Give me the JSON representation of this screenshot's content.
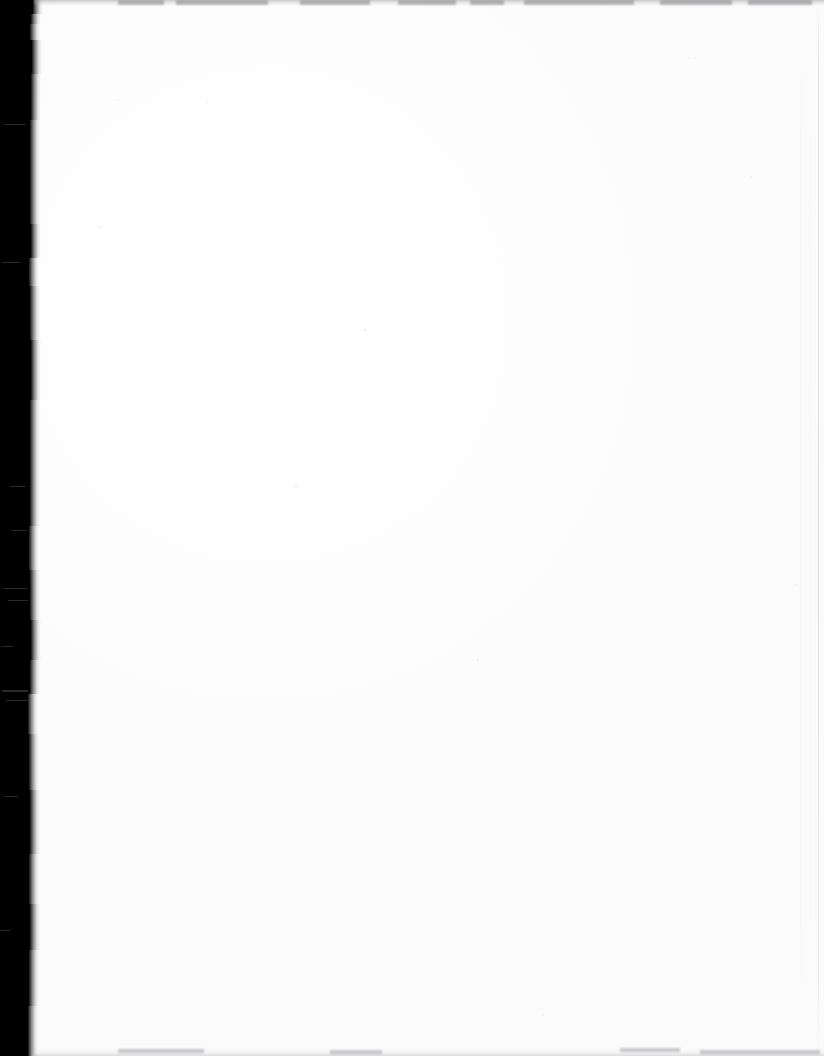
{
  "page": {
    "width": 824,
    "height": 1056,
    "background_color": "#ffffff",
    "paper_color": "#fefefe",
    "content_text": "",
    "visible_text_present": false
  },
  "scan_edge": {
    "name": "left-scanner-bed-band",
    "color": "#000000",
    "x": 0,
    "width_min": 27,
    "width_max": 34,
    "height": 1056,
    "segments": [
      {
        "top": 0,
        "height": 14,
        "width": 33
      },
      {
        "top": 14,
        "height": 10,
        "width": 31
      },
      {
        "top": 24,
        "height": 16,
        "width": 30
      },
      {
        "top": 40,
        "height": 34,
        "width": 32
      },
      {
        "top": 74,
        "height": 46,
        "width": 31
      },
      {
        "top": 120,
        "height": 60,
        "width": 30
      },
      {
        "top": 180,
        "height": 44,
        "width": 30
      },
      {
        "top": 224,
        "height": 34,
        "width": 31
      },
      {
        "top": 258,
        "height": 28,
        "width": 29
      },
      {
        "top": 286,
        "height": 54,
        "width": 30
      },
      {
        "top": 340,
        "height": 60,
        "width": 31
      },
      {
        "top": 400,
        "height": 70,
        "width": 30
      },
      {
        "top": 470,
        "height": 56,
        "width": 30
      },
      {
        "top": 526,
        "height": 44,
        "width": 29
      },
      {
        "top": 570,
        "height": 50,
        "width": 30
      },
      {
        "top": 620,
        "height": 40,
        "width": 31
      },
      {
        "top": 660,
        "height": 34,
        "width": 30
      },
      {
        "top": 694,
        "height": 40,
        "width": 28
      },
      {
        "top": 734,
        "height": 56,
        "width": 29
      },
      {
        "top": 790,
        "height": 64,
        "width": 30
      },
      {
        "top": 854,
        "height": 50,
        "width": 29
      },
      {
        "top": 904,
        "height": 46,
        "width": 30
      },
      {
        "top": 950,
        "height": 56,
        "width": 29
      },
      {
        "top": 1006,
        "height": 50,
        "width": 28
      }
    ],
    "scratches": [
      {
        "top": 124,
        "left": 4,
        "width": 22,
        "height": 1
      },
      {
        "top": 262,
        "left": 2,
        "width": 18,
        "height": 1
      },
      {
        "top": 486,
        "left": 10,
        "width": 16,
        "height": 1
      },
      {
        "top": 530,
        "left": 12,
        "width": 15,
        "height": 1
      },
      {
        "top": 588,
        "left": 3,
        "width": 24,
        "height": 1
      },
      {
        "top": 600,
        "left": 8,
        "width": 20,
        "height": 1
      },
      {
        "top": 646,
        "left": 1,
        "width": 12,
        "height": 1
      },
      {
        "top": 690,
        "left": 2,
        "width": 26,
        "height": 2
      },
      {
        "top": 700,
        "left": 6,
        "width": 22,
        "height": 1
      },
      {
        "top": 796,
        "left": 4,
        "width": 14,
        "height": 1
      },
      {
        "top": 930,
        "left": 0,
        "width": 10,
        "height": 1
      }
    ]
  },
  "top_edge": {
    "name": "top-smudge-line",
    "color": "#82828455",
    "y": 0,
    "height": 6,
    "blotches": [
      {
        "left": 118,
        "width": 46
      },
      {
        "left": 176,
        "width": 92
      },
      {
        "left": 300,
        "width": 70
      },
      {
        "left": 398,
        "width": 58
      },
      {
        "left": 470,
        "width": 34
      },
      {
        "left": 524,
        "width": 110
      },
      {
        "left": 660,
        "width": 72
      },
      {
        "left": 748,
        "width": 64
      }
    ]
  },
  "bottom_edge": {
    "name": "bottom-smudge-line",
    "color": "#78787c",
    "height": 7,
    "streaks": [
      {
        "left": 118,
        "bottom": 3,
        "width": 86
      },
      {
        "left": 330,
        "bottom": 2,
        "width": 52
      },
      {
        "left": 620,
        "bottom": 4,
        "width": 60
      },
      {
        "left": 700,
        "bottom": 2,
        "width": 120
      }
    ]
  },
  "right_edge": {
    "name": "right-margin-line",
    "color": "#acaeb4",
    "lines": [
      {
        "x": 818,
        "opacity": 0.62,
        "soft": false
      },
      {
        "x": 800,
        "opacity": 0.3,
        "soft": true
      },
      {
        "x": 810,
        "opacity": 0.22,
        "soft": true
      }
    ]
  },
  "specks": [
    {
      "x": 364,
      "y": 329,
      "size": 2,
      "color": "#e9e9ec"
    },
    {
      "x": 295,
      "y": 486,
      "size": 2,
      "color": "#ececef"
    },
    {
      "x": 477,
      "y": 659,
      "size": 2,
      "color": "#eeeef1"
    },
    {
      "x": 206,
      "y": 100,
      "size": 2,
      "color": "#f0f0f2"
    },
    {
      "x": 117,
      "y": 99,
      "size": 2,
      "color": "#f1f1f3"
    },
    {
      "x": 688,
      "y": 57,
      "size": 2,
      "color": "#f0f0f3"
    },
    {
      "x": 750,
      "y": 176,
      "size": 2,
      "color": "#f1f1f4"
    },
    {
      "x": 542,
      "y": 1014,
      "size": 2,
      "color": "#eff0f2"
    },
    {
      "x": 99,
      "y": 226,
      "size": 2,
      "color": "#f2f2f4"
    },
    {
      "x": 795,
      "y": 584,
      "size": 2,
      "color": "#f0f1f3"
    },
    {
      "x": 69,
      "y": 224,
      "size": 1,
      "color": "#f3f3f5"
    },
    {
      "x": 130,
      "y": 285,
      "size": 1,
      "color": "#f2f3f5"
    }
  ]
}
